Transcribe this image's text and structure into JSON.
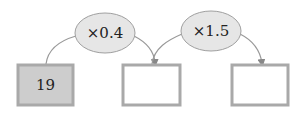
{
  "diagram": {
    "operations": [
      {
        "label": "×0.4"
      },
      {
        "label": "×1.5"
      }
    ],
    "boxes": [
      {
        "value": "19",
        "filled": true
      },
      {
        "value": "",
        "filled": false
      },
      {
        "value": "",
        "filled": false
      }
    ],
    "colors": {
      "box_border": "#a9a9a9",
      "box_fill_given": "#cdcdcd",
      "ellipse_fill": "#e6e6e6",
      "ellipse_border": "#a0a0a0",
      "arrow": "#888888"
    }
  }
}
